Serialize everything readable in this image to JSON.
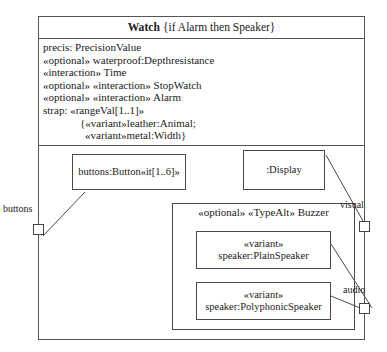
{
  "diagram": {
    "kind": "uml-composite-structure",
    "classifier": {
      "name": "Watch",
      "constraint": "{if Alarm then Speaker}"
    },
    "attributes": [
      {
        "text": "precis: PrecisionValue",
        "indent": 0
      },
      {
        "text": "«optional» waterproof:Depthresistance",
        "indent": 0
      },
      {
        "text": "«interaction» Time",
        "indent": 0
      },
      {
        "text": "«optional» «interaction» StopWatch",
        "indent": 0
      },
      {
        "text": "«optional» «interaction» Alarm",
        "indent": 0
      },
      {
        "text": "strap: «rangeVal[1..1]»",
        "indent": 0
      },
      {
        "text": "{«variant»leather:Animal;",
        "indent": 1
      },
      {
        "text": "«variant»metal:Width}",
        "indent": 2
      }
    ],
    "parts": {
      "buttons": {
        "label": "buttons:Button«it[1..6]»"
      },
      "display": {
        "label": ":Display"
      },
      "buzzer": {
        "title": "«optional» «TypeAlt» Buzzer",
        "variants": [
          {
            "stereotype": "«variant»",
            "label": "speaker:PlainSpeaker"
          },
          {
            "stereotype": "«variant»",
            "label": "speaker:PolyphonicSpeaker"
          }
        ]
      }
    },
    "ports": [
      {
        "name": "buttons",
        "side": "left"
      },
      {
        "name": "visual",
        "side": "right"
      },
      {
        "name": "audio",
        "side": "right"
      }
    ],
    "colors": {
      "stroke": "#4a4a4a",
      "background": "#ffffff",
      "text": "#1a1a1a"
    }
  }
}
